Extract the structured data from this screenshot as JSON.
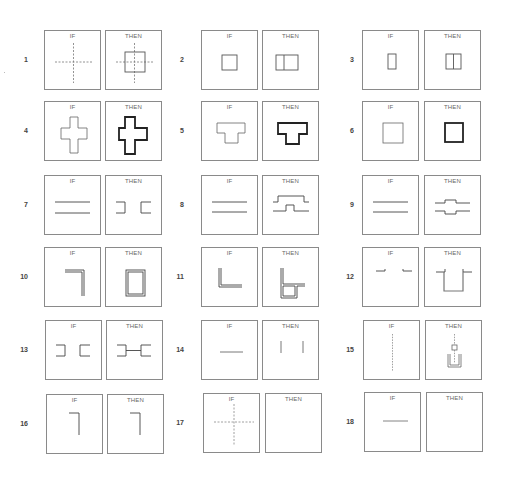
{
  "diagram": {
    "panel_labels": {
      "if": "IF",
      "then": "THEN"
    },
    "rules": [
      {
        "number": "1",
        "if": "dashed-cross-axes",
        "then": "square-centered-on-dashed-axes"
      },
      {
        "number": "2",
        "if": "small-square",
        "then": "square-extended-into-two-cells"
      },
      {
        "number": "3",
        "if": "tall-rectangle",
        "then": "rectangle-split-in-two"
      },
      {
        "number": "4",
        "if": "thin-cross-outline",
        "then": "thick-cross-outline"
      },
      {
        "number": "5",
        "if": "thin-t-outline",
        "then": "thick-t-outline"
      },
      {
        "number": "6",
        "if": "thin-square",
        "then": "thick-square"
      },
      {
        "number": "7",
        "if": "two-parallel-lines",
        "then": "two-facing-brackets"
      },
      {
        "number": "8",
        "if": "two-parallel-lines",
        "then": "lines-with-raised-steps"
      },
      {
        "number": "9",
        "if": "two-parallel-lines",
        "then": "lines-bulging-apart"
      },
      {
        "number": "10",
        "if": "double-line-corner",
        "then": "double-line-rectangle"
      },
      {
        "number": "11",
        "if": "double-line-l-shape",
        "then": "l-shape-with-box"
      },
      {
        "number": "12",
        "if": "two-short-hooks",
        "then": "hooks-joined-by-u-channel"
      },
      {
        "number": "13",
        "if": "two-facing-brackets",
        "then": "brackets-joined-by-line"
      },
      {
        "number": "14",
        "if": "horizontal-line",
        "then": "two-vertical-lines"
      },
      {
        "number": "15",
        "if": "dashed-vertical-axis",
        "then": "axis-with-small-square-and-u"
      },
      {
        "number": "16",
        "if": "corner-line",
        "then": "corner-line"
      },
      {
        "number": "17",
        "if": "dashed-cross-axes",
        "then": "empty"
      },
      {
        "number": "18",
        "if": "horizontal-line",
        "then": "empty"
      }
    ]
  }
}
